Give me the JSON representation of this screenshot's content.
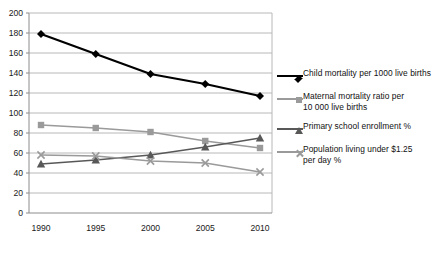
{
  "chart_data": {
    "type": "line",
    "title": "",
    "xlabel": "",
    "ylabel": "",
    "categories": [
      "1990",
      "1995",
      "2000",
      "2005",
      "2010"
    ],
    "x": [
      1990,
      1995,
      2000,
      2005,
      2010
    ],
    "ylim": [
      0,
      200
    ],
    "ytick_step": 20,
    "yticks": [
      "0",
      "20",
      "40",
      "60",
      "80",
      "100",
      "120",
      "140",
      "160",
      "180",
      "200"
    ],
    "grid": true,
    "grid_axis": "y",
    "legend_position": "right",
    "series": [
      {
        "name": "Child mortality per 1000 live births",
        "label_line1": "Child mortality per 1000 live births",
        "label_line2": "",
        "marker": "diamond",
        "color": "#000000",
        "values": [
          179,
          159,
          139,
          129,
          117
        ]
      },
      {
        "name": "Maternal mortality ratio per 10 000 live births",
        "label_line1": "Maternal mortality ratio per",
        "label_line2": "10 000 live births",
        "marker": "square",
        "color": "#9a9a9a",
        "values": [
          88,
          85,
          81,
          72,
          65
        ]
      },
      {
        "name": "Primary school enrollment %",
        "label_line1": "Primary school enrollment %",
        "label_line2": "",
        "marker": "triangle",
        "color": "#585858",
        "values": [
          49,
          53,
          58,
          66,
          75
        ]
      },
      {
        "name": "Population living under $1.25 per day %",
        "label_line1": "Population living under $1.25",
        "label_line2": "per day %",
        "marker": "cross",
        "color": "#9a9a9a",
        "values": [
          58,
          57,
          52,
          50,
          41
        ]
      }
    ]
  },
  "axes": {
    "y_labels": [
      "200",
      "180",
      "160",
      "140",
      "120",
      "100",
      "80",
      "60",
      "40",
      "20",
      "0"
    ],
    "x_labels": [
      "1990",
      "1995",
      "2000",
      "2005",
      "2010"
    ]
  },
  "colors": {
    "background": "#ffffff",
    "gridline": "#b8b8b8",
    "axis": "#8c8c8c",
    "series_child": "#000000",
    "series_maternal": "#9a9a9a",
    "series_primary": "#585858",
    "series_population": "#9a9a9a"
  }
}
